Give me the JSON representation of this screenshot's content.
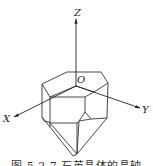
{
  "figure": {
    "caption": "图 5.2.7  石英晶体的晶轴",
    "axes": {
      "z_label": "Z",
      "x_label": "X",
      "y_label": "Y",
      "origin_label": "O"
    },
    "stroke_color": "#222222",
    "background": "#ffffff"
  }
}
